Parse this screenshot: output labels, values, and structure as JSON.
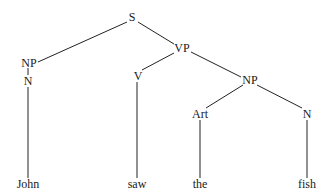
{
  "tree": {
    "nodes": {
      "s": {
        "label": "S",
        "x": 132,
        "y": 17
      },
      "vp": {
        "label": "VP",
        "x": 182,
        "y": 48
      },
      "np_subj": {
        "label": "NP",
        "x": 29,
        "y": 63
      },
      "n_subj": {
        "label": "N",
        "x": 28,
        "y": 81
      },
      "v": {
        "label": "V",
        "x": 138,
        "y": 76
      },
      "np_obj": {
        "label": "NP",
        "x": 250,
        "y": 80
      },
      "art": {
        "label": "Art",
        "x": 200,
        "y": 114
      },
      "n_obj": {
        "label": "N",
        "x": 307,
        "y": 114
      }
    },
    "leaves": {
      "john": {
        "label": "John",
        "x": 28,
        "y": 184
      },
      "saw": {
        "label": "saw",
        "x": 137,
        "y": 184
      },
      "the": {
        "label": "the",
        "x": 200,
        "y": 184
      },
      "fish": {
        "label": "fish",
        "x": 307,
        "y": 184
      }
    },
    "line_color": "#222222"
  }
}
